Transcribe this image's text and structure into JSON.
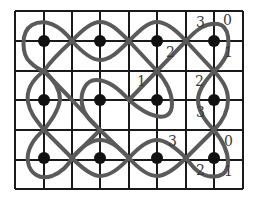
{
  "diagram": {
    "title": "",
    "grid": {
      "columns_x": [
        15,
        44,
        72,
        100,
        129,
        157,
        186,
        214,
        243
      ],
      "rows_y": [
        11,
        41,
        71,
        100,
        130,
        160,
        189
      ],
      "line_color": "#1a1a1a"
    },
    "dots": [
      {
        "x": 44,
        "y": 41
      },
      {
        "x": 100,
        "y": 41
      },
      {
        "x": 157,
        "y": 41
      },
      {
        "x": 214,
        "y": 41
      },
      {
        "x": 44,
        "y": 100
      },
      {
        "x": 100,
        "y": 100
      },
      {
        "x": 157,
        "y": 100
      },
      {
        "x": 214,
        "y": 100
      },
      {
        "x": 44,
        "y": 158
      },
      {
        "x": 100,
        "y": 158
      },
      {
        "x": 157,
        "y": 158
      },
      {
        "x": 214,
        "y": 158
      }
    ],
    "curve_color": "#5a5a5a",
    "labels": [
      {
        "text": "3",
        "x": 196,
        "y": 27
      },
      {
        "text": "0",
        "x": 223,
        "y": 25
      },
      {
        "text": "2",
        "x": 166,
        "y": 57
      },
      {
        "text": "1",
        "x": 224,
        "y": 57
      },
      {
        "text": "1",
        "x": 137,
        "y": 86
      },
      {
        "text": "2",
        "x": 195,
        "y": 86
      },
      {
        "text": "3",
        "x": 196,
        "y": 117
      },
      {
        "text": "3",
        "x": 168,
        "y": 146
      },
      {
        "text": "0",
        "x": 224,
        "y": 146
      },
      {
        "text": "2",
        "x": 196,
        "y": 175
      },
      {
        "text": "1",
        "x": 224,
        "y": 176
      }
    ]
  }
}
